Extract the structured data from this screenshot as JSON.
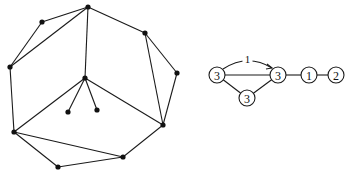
{
  "left_graph": {
    "nodes": [
      {
        "id": "top",
        "x": 88,
        "y": 7
      },
      {
        "id": "upper-left",
        "x": 42,
        "y": 22
      },
      {
        "id": "left",
        "x": 10,
        "y": 67
      },
      {
        "id": "lower-left",
        "x": 14,
        "y": 132
      },
      {
        "id": "bottom",
        "x": 58,
        "y": 167
      },
      {
        "id": "bottom-right",
        "x": 123,
        "y": 157
      },
      {
        "id": "lower-right",
        "x": 163,
        "y": 125
      },
      {
        "id": "right",
        "x": 177,
        "y": 73
      },
      {
        "id": "upper-right",
        "x": 145,
        "y": 33
      },
      {
        "id": "center",
        "x": 85,
        "y": 78
      },
      {
        "id": "pendant-1",
        "x": 68,
        "y": 112
      },
      {
        "id": "pendant-2",
        "x": 97,
        "y": 110
      }
    ],
    "edges": [
      [
        "top",
        "upper-left"
      ],
      [
        "upper-left",
        "left"
      ],
      [
        "left",
        "top"
      ],
      [
        "left",
        "lower-left"
      ],
      [
        "lower-left",
        "bottom"
      ],
      [
        "bottom",
        "bottom-right"
      ],
      [
        "lower-left",
        "bottom-right"
      ],
      [
        "bottom-right",
        "lower-right"
      ],
      [
        "lower-right",
        "right"
      ],
      [
        "right",
        "upper-right"
      ],
      [
        "upper-right",
        "lower-right"
      ],
      [
        "upper-right",
        "top"
      ],
      [
        "top",
        "center"
      ],
      [
        "center",
        "lower-left"
      ],
      [
        "center",
        "lower-right"
      ],
      [
        "center",
        "pendant-1"
      ],
      [
        "center",
        "pendant-2"
      ]
    ]
  },
  "right_graph": {
    "nodes": [
      {
        "id": "a",
        "label": "3",
        "x": 217,
        "y": 75
      },
      {
        "id": "b",
        "label": "3",
        "x": 278,
        "y": 75
      },
      {
        "id": "c",
        "label": "1",
        "x": 309,
        "y": 75
      },
      {
        "id": "d",
        "label": "2",
        "x": 336,
        "y": 75
      },
      {
        "id": "e",
        "label": "3",
        "x": 247,
        "y": 98
      }
    ],
    "edges": [
      [
        "a",
        "b"
      ],
      [
        "a",
        "e"
      ],
      [
        "e",
        "b"
      ],
      [
        "b",
        "c"
      ],
      [
        "c",
        "d"
      ]
    ],
    "arc": {
      "from": "a",
      "to": "b",
      "label": "1"
    }
  }
}
